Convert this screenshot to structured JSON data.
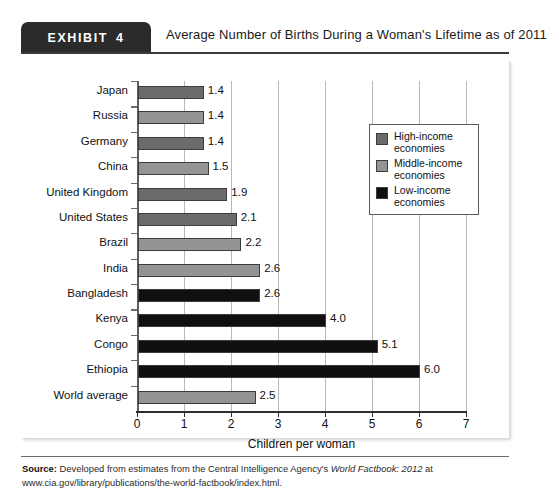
{
  "exhibit": {
    "badge_word": "EXHIBIT",
    "badge_number": "4",
    "title": "Average Number of Births During a Woman's Lifetime as of 2011"
  },
  "legend": {
    "items": [
      {
        "label_line1": "High-income",
        "label_line2": "economies",
        "color": "#6b6b6b",
        "key": "high-income"
      },
      {
        "label_line1": "Middle-income",
        "label_line2": "economies",
        "color": "#949494",
        "key": "middle-income"
      },
      {
        "label_line1": "Low-income",
        "label_line2": "economies",
        "color": "#101010",
        "key": "low-income"
      }
    ]
  },
  "source": {
    "label": "Source:",
    "text_part1": " Developed from estimates from the Central Intelligence Agency's ",
    "italic_part": "World Factbook: 2012",
    "text_part2": " at www.cia.gov/library/publications/the-world-factbook/index.html."
  },
  "chart_data": {
    "type": "bar",
    "orientation": "horizontal",
    "title": "Average Number of Births During a Woman's Lifetime as of 2011",
    "xlabel": "Children per woman",
    "ylabel": "",
    "xlim": [
      0,
      7
    ],
    "xticks": [
      0,
      1,
      2,
      3,
      4,
      5,
      6,
      7
    ],
    "xticklabels": [
      "0",
      "1",
      "2",
      "3",
      "4",
      "5",
      "6",
      "7"
    ],
    "grid": true,
    "grid_axis": "x",
    "legend_position": "upper right",
    "categories": [
      "Japan",
      "Russia",
      "Germany",
      "China",
      "United Kingdom",
      "United States",
      "Brazil",
      "India",
      "Bangladesh",
      "Kenya",
      "Congo",
      "Ethiopia",
      "World average"
    ],
    "values": [
      1.4,
      1.4,
      1.4,
      1.5,
      1.9,
      2.1,
      2.2,
      2.6,
      2.6,
      4.0,
      5.1,
      6.0,
      2.5
    ],
    "value_labels": [
      "1.4",
      "1.4",
      "1.4",
      "1.5",
      "1.9",
      "2.1",
      "2.2",
      "2.6",
      "2.6",
      "4.0",
      "5.1",
      "6.0",
      "2.5"
    ],
    "groups": [
      "high-income",
      "middle-income",
      "high-income",
      "middle-income",
      "high-income",
      "high-income",
      "middle-income",
      "middle-income",
      "low-income",
      "low-income",
      "low-income",
      "low-income",
      "middle-income"
    ],
    "group_colors": {
      "high-income": "#6b6b6b",
      "middle-income": "#949494",
      "low-income": "#101010"
    }
  }
}
